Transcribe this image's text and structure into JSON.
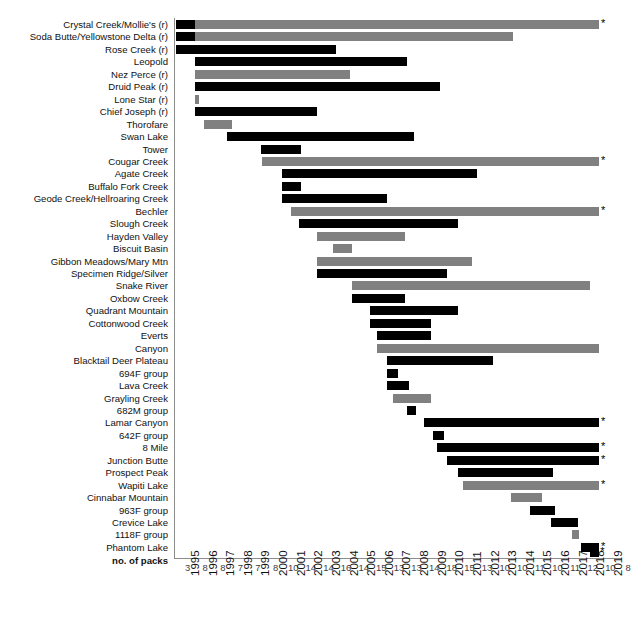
{
  "chart_data": {
    "type": "bar",
    "orientation": "horizontal-timeline",
    "title": "",
    "xlabel": "",
    "ylabel": "",
    "xlim": [
      1995,
      2020
    ],
    "grid": false,
    "legend": "none",
    "axis_note": "Each bar spans the years a wolf pack existed; trailing * marks packs still present in 2019.",
    "colors": {
      "black": "#000000",
      "gray": "#808080"
    },
    "x_tick_labels": [
      "1995",
      "1996",
      "1997",
      "1998",
      "1999",
      "2000",
      "2001",
      "2002",
      "2003",
      "2004",
      "2005",
      "2006",
      "2007",
      "2008",
      "2009",
      "2010",
      "2011",
      "2012",
      "2013",
      "2014",
      "2015",
      "2016",
      "2017",
      "2018",
      "2019"
    ],
    "counts_row_label": "no. of packs",
    "counts": [
      3,
      8,
      8,
      7,
      7,
      8,
      10,
      14,
      14,
      16,
      14,
      15,
      13,
      13,
      14,
      18,
      15,
      13,
      10,
      10,
      11,
      10,
      11,
      12,
      10,
      8
    ],
    "categories": [
      "Crystal Creek/Mollie's (r)",
      "Soda Butte/Yellowstone Delta (r)",
      "Rose Creek (r)",
      "Leopold",
      "Nez Perce (r)",
      "Druid Peak (r)",
      "Lone Star (r)",
      "Chief Joseph (r)",
      "Thorofare",
      "Swan Lake",
      "Tower",
      "Cougar Creek",
      "Agate Creek",
      "Buffalo Fork Creek",
      "Geode Creek/Hellroaring Creek",
      "Bechler",
      "Slough Creek",
      "Hayden Valley",
      "Biscuit Basin",
      "Gibbon Meadows/Mary Mtn",
      "Specimen Ridge/Silver",
      "Snake River",
      "Oxbow Creek",
      "Quadrant Mountain",
      "Cottonwood Creek",
      "Everts",
      "Canyon",
      "Blacktail Deer Plateau",
      "694F group",
      "Lava Creek",
      "Grayling Creek",
      "682M group",
      "Lamar Canyon",
      "642F group",
      "8 Mile",
      "Junction Butte",
      "Prospect Peak",
      "Wapiti Lake",
      "Cinnabar Mountain",
      "963F group",
      "Crevice Lake",
      "1118F group",
      "Phantom Lake"
    ],
    "bars": [
      {
        "name": "Crystal Creek/Mollie's (r)",
        "segments": [
          {
            "start": 1995.0,
            "end": 1996.1,
            "color": "black"
          },
          {
            "start": 1996.1,
            "end": 2019.0,
            "color": "gray"
          }
        ],
        "active_2019": true
      },
      {
        "name": "Soda Butte/Yellowstone Delta (r)",
        "segments": [
          {
            "start": 1995.0,
            "end": 1996.1,
            "color": "black"
          },
          {
            "start": 1996.1,
            "end": 2014.1,
            "color": "gray"
          }
        ],
        "active_2019": false
      },
      {
        "name": "Rose Creek (r)",
        "segments": [
          {
            "start": 1995.0,
            "end": 2004.1,
            "color": "black"
          }
        ],
        "active_2019": false
      },
      {
        "name": "Leopold",
        "segments": [
          {
            "start": 1996.1,
            "end": 2008.1,
            "color": "black"
          }
        ],
        "active_2019": false
      },
      {
        "name": "Nez Perce (r)",
        "segments": [
          {
            "start": 1996.1,
            "end": 2004.9,
            "color": "gray"
          }
        ],
        "active_2019": false
      },
      {
        "name": "Druid Peak (r)",
        "segments": [
          {
            "start": 1996.1,
            "end": 2010.0,
            "color": "black"
          }
        ],
        "active_2019": false
      },
      {
        "name": "Lone Star (r)",
        "segments": [
          {
            "start": 1996.1,
            "end": 1996.3,
            "color": "gray"
          }
        ],
        "active_2019": false
      },
      {
        "name": "Chief Joseph (r)",
        "segments": [
          {
            "start": 1996.1,
            "end": 2003.0,
            "color": "black"
          }
        ],
        "active_2019": false
      },
      {
        "name": "Thorofare",
        "segments": [
          {
            "start": 1996.6,
            "end": 1998.2,
            "color": "gray"
          }
        ],
        "active_2019": false
      },
      {
        "name": "Swan Lake",
        "segments": [
          {
            "start": 1997.9,
            "end": 2008.5,
            "color": "black"
          }
        ],
        "active_2019": false
      },
      {
        "name": "Tower",
        "segments": [
          {
            "start": 1999.8,
            "end": 2002.1,
            "color": "black"
          }
        ],
        "active_2019": false
      },
      {
        "name": "Cougar Creek",
        "segments": [
          {
            "start": 1999.9,
            "end": 2019.0,
            "color": "gray"
          }
        ],
        "active_2019": true
      },
      {
        "name": "Agate Creek",
        "segments": [
          {
            "start": 2001.0,
            "end": 2012.1,
            "color": "black"
          }
        ],
        "active_2019": false
      },
      {
        "name": "Buffalo Fork Creek",
        "segments": [
          {
            "start": 2001.0,
            "end": 2002.1,
            "color": "black"
          }
        ],
        "active_2019": false
      },
      {
        "name": "Geode Creek/Hellroaring Creek",
        "segments": [
          {
            "start": 2001.0,
            "end": 2007.0,
            "color": "black"
          }
        ],
        "active_2019": false
      },
      {
        "name": "Bechler",
        "segments": [
          {
            "start": 2001.5,
            "end": 2019.0,
            "color": "gray"
          }
        ],
        "active_2019": true
      },
      {
        "name": "Slough Creek",
        "segments": [
          {
            "start": 2002.0,
            "end": 2011.0,
            "color": "black"
          }
        ],
        "active_2019": false
      },
      {
        "name": "Hayden Valley",
        "segments": [
          {
            "start": 2003.0,
            "end": 2008.0,
            "color": "gray"
          }
        ],
        "active_2019": false
      },
      {
        "name": "Biscuit Basin",
        "segments": [
          {
            "start": 2003.9,
            "end": 2005.0,
            "color": "gray"
          }
        ],
        "active_2019": false
      },
      {
        "name": "Gibbon Meadows/Mary Mtn",
        "segments": [
          {
            "start": 2003.0,
            "end": 2011.8,
            "color": "gray"
          }
        ],
        "active_2019": false
      },
      {
        "name": "Specimen Ridge/Silver",
        "segments": [
          {
            "start": 2003.0,
            "end": 2010.4,
            "color": "black"
          }
        ],
        "active_2019": false
      },
      {
        "name": "Snake River",
        "segments": [
          {
            "start": 2005.0,
            "end": 2018.5,
            "color": "gray"
          }
        ],
        "active_2019": false
      },
      {
        "name": "Oxbow Creek",
        "segments": [
          {
            "start": 2005.0,
            "end": 2008.0,
            "color": "black"
          }
        ],
        "active_2019": false
      },
      {
        "name": "Quadrant Mountain",
        "segments": [
          {
            "start": 2006.0,
            "end": 2011.0,
            "color": "black"
          }
        ],
        "active_2019": false
      },
      {
        "name": "Cottonwood Creek",
        "segments": [
          {
            "start": 2006.0,
            "end": 2009.5,
            "color": "black"
          }
        ],
        "active_2019": false
      },
      {
        "name": "Everts",
        "segments": [
          {
            "start": 2006.4,
            "end": 2009.5,
            "color": "black"
          }
        ],
        "active_2019": false
      },
      {
        "name": "Canyon",
        "segments": [
          {
            "start": 2006.4,
            "end": 2019.0,
            "color": "gray"
          }
        ],
        "active_2019": false
      },
      {
        "name": "Blacktail Deer Plateau",
        "segments": [
          {
            "start": 2007.0,
            "end": 2013.0,
            "color": "black"
          }
        ],
        "active_2019": false
      },
      {
        "name": "694F group",
        "segments": [
          {
            "start": 2007.0,
            "end": 2007.6,
            "color": "black"
          }
        ],
        "active_2019": false
      },
      {
        "name": "Lava Creek",
        "segments": [
          {
            "start": 2007.0,
            "end": 2008.2,
            "color": "black"
          }
        ],
        "active_2019": false
      },
      {
        "name": "Grayling Creek",
        "segments": [
          {
            "start": 2007.3,
            "end": 2009.5,
            "color": "gray"
          }
        ],
        "active_2019": false
      },
      {
        "name": "682M group",
        "segments": [
          {
            "start": 2008.1,
            "end": 2008.6,
            "color": "black"
          }
        ],
        "active_2019": false
      },
      {
        "name": "Lamar Canyon",
        "segments": [
          {
            "start": 2009.1,
            "end": 2019.0,
            "color": "black"
          }
        ],
        "active_2019": true
      },
      {
        "name": "642F group",
        "segments": [
          {
            "start": 2009.6,
            "end": 2010.2,
            "color": "black"
          }
        ],
        "active_2019": false
      },
      {
        "name": "8 Mile",
        "segments": [
          {
            "start": 2009.8,
            "end": 2019.0,
            "color": "black"
          }
        ],
        "active_2019": true
      },
      {
        "name": "Junction Butte",
        "segments": [
          {
            "start": 2010.4,
            "end": 2019.0,
            "color": "black"
          }
        ],
        "active_2019": true
      },
      {
        "name": "Prospect Peak",
        "segments": [
          {
            "start": 2011.0,
            "end": 2016.4,
            "color": "black"
          }
        ],
        "active_2019": false
      },
      {
        "name": "Wapiti Lake",
        "segments": [
          {
            "start": 2011.3,
            "end": 2019.0,
            "color": "gray"
          }
        ],
        "active_2019": true
      },
      {
        "name": "Cinnabar Mountain",
        "segments": [
          {
            "start": 2014.0,
            "end": 2015.8,
            "color": "gray"
          }
        ],
        "active_2019": false
      },
      {
        "name": "963F group",
        "segments": [
          {
            "start": 2015.1,
            "end": 2016.5,
            "color": "black"
          }
        ],
        "active_2019": false
      },
      {
        "name": "Crevice Lake",
        "segments": [
          {
            "start": 2016.3,
            "end": 2017.8,
            "color": "black"
          }
        ],
        "active_2019": false
      },
      {
        "name": "1118F group",
        "segments": [
          {
            "start": 2017.5,
            "end": 2017.9,
            "color": "gray"
          }
        ],
        "active_2019": false
      },
      {
        "name": "Phantom Lake",
        "segments": [
          {
            "start": 2018.0,
            "end": 2019.0,
            "color": "black"
          }
        ],
        "active_2019": true
      }
    ]
  }
}
